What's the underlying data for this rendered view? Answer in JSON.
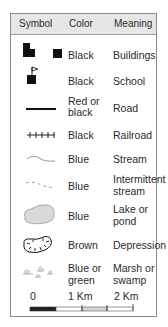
{
  "header": {
    "symbol": "Symbol",
    "color": "Color",
    "meaning": "Meaning"
  },
  "rows": [
    {
      "icon": "buildings-icon",
      "color": "Black",
      "meaning": "Buildings"
    },
    {
      "icon": "school-icon",
      "color": "Black",
      "meaning": "School"
    },
    {
      "icon": "road-icon",
      "color_line1": "Red or",
      "color_line2": "black",
      "meaning": "Road"
    },
    {
      "icon": "railroad-icon",
      "color": "Black",
      "meaning": "Railroad"
    },
    {
      "icon": "stream-icon",
      "color": "Blue",
      "meaning": "Stream"
    },
    {
      "icon": "intermittent-stream-icon",
      "color": "Blue",
      "meaning_line1": "Intermittent",
      "meaning_line2": "stream"
    },
    {
      "icon": "lake-icon",
      "color": "Blue",
      "meaning_line1": "Lake or",
      "meaning_line2": "pond"
    },
    {
      "icon": "depression-icon",
      "color": "Brown",
      "meaning": "Depression"
    },
    {
      "icon": "marsh-icon",
      "color_line1": "Blue or",
      "color_line2": "green",
      "meaning_line1": "Marsh or",
      "meaning_line2": "swamp"
    }
  ],
  "scale": {
    "label_0": "0",
    "label_1": "1 Km",
    "label_2": "2 Km"
  },
  "colors": {
    "header_bg": "#e6e6e6",
    "border": "#8a8a8a",
    "lake_fill": "#d9d9d9",
    "symbol": "#111111"
  }
}
